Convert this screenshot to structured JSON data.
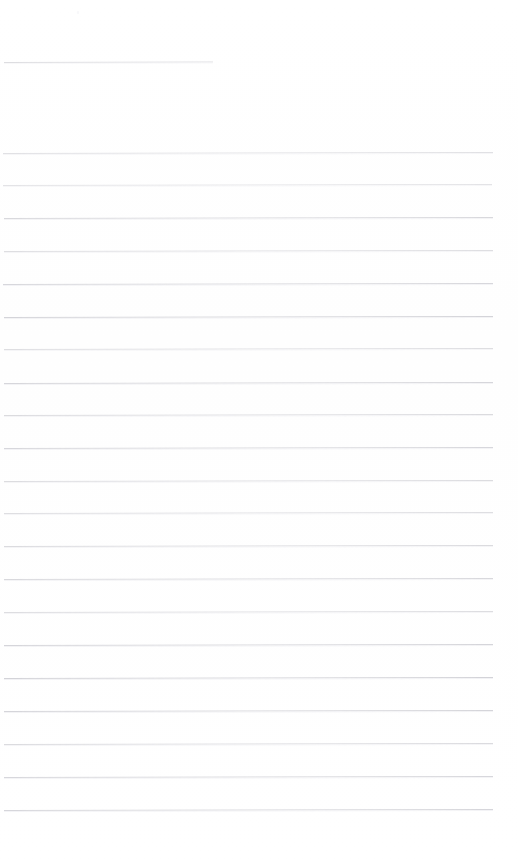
{
  "document": {
    "kind": "scanned-blank-ruled-page",
    "page_width": 518,
    "page_height": 864,
    "background_color": "#ffffff",
    "rule_color": "#c9c9cf",
    "visible_text": "",
    "caption": "Blank scanned ruled notebook page with no handwriting or printed text"
  },
  "rules": [
    {
      "id": "rule-header",
      "y": 62,
      "x": 4,
      "width": 209,
      "opacity": 0.62,
      "slope": -0.6,
      "kind": "short"
    },
    {
      "id": "rule-1",
      "y": 153,
      "x": 3,
      "width": 490,
      "opacity": 0.55,
      "slope": -0.9,
      "kind": "full"
    },
    {
      "id": "rule-2",
      "y": 185,
      "x": 3,
      "width": 489,
      "opacity": 0.5,
      "slope": -1.0,
      "kind": "full"
    },
    {
      "id": "rule-3",
      "y": 218,
      "x": 4,
      "width": 489,
      "opacity": 0.7,
      "slope": -1.1,
      "kind": "full"
    },
    {
      "id": "rule-4",
      "y": 251,
      "x": 4,
      "width": 489,
      "opacity": 0.6,
      "slope": -1.0,
      "kind": "full"
    },
    {
      "id": "rule-5",
      "y": 284,
      "x": 3,
      "width": 490,
      "opacity": 0.72,
      "slope": -1.0,
      "kind": "full"
    },
    {
      "id": "rule-6",
      "y": 317,
      "x": 4,
      "width": 489,
      "opacity": 0.78,
      "slope": -1.1,
      "kind": "full"
    },
    {
      "id": "rule-7",
      "y": 349,
      "x": 4,
      "width": 489,
      "opacity": 0.6,
      "slope": -1.0,
      "kind": "full"
    },
    {
      "id": "rule-8",
      "y": 383,
      "x": 4,
      "width": 489,
      "opacity": 0.74,
      "slope": -1.0,
      "kind": "full"
    },
    {
      "id": "rule-9",
      "y": 415,
      "x": 4,
      "width": 489,
      "opacity": 0.66,
      "slope": -1.0,
      "kind": "full"
    },
    {
      "id": "rule-10",
      "y": 448,
      "x": 4,
      "width": 489,
      "opacity": 0.72,
      "slope": -1.0,
      "kind": "full"
    },
    {
      "id": "rule-11",
      "y": 481,
      "x": 4,
      "width": 489,
      "opacity": 0.64,
      "slope": -1.0,
      "kind": "full"
    },
    {
      "id": "rule-12",
      "y": 513,
      "x": 4,
      "width": 489,
      "opacity": 0.6,
      "slope": -1.0,
      "kind": "full"
    },
    {
      "id": "rule-13",
      "y": 546,
      "x": 4,
      "width": 489,
      "opacity": 0.66,
      "slope": -1.0,
      "kind": "full"
    },
    {
      "id": "rule-14",
      "y": 579,
      "x": 4,
      "width": 489,
      "opacity": 0.7,
      "slope": -1.0,
      "kind": "full"
    },
    {
      "id": "rule-15",
      "y": 612,
      "x": 4,
      "width": 489,
      "opacity": 0.62,
      "slope": -1.0,
      "kind": "full"
    },
    {
      "id": "rule-16",
      "y": 645,
      "x": 4,
      "width": 489,
      "opacity": 0.76,
      "slope": -1.0,
      "kind": "full"
    },
    {
      "id": "rule-17",
      "y": 678,
      "x": 4,
      "width": 489,
      "opacity": 0.8,
      "slope": -1.0,
      "kind": "full"
    },
    {
      "id": "rule-18",
      "y": 711,
      "x": 4,
      "width": 489,
      "opacity": 0.76,
      "slope": -1.0,
      "kind": "full"
    },
    {
      "id": "rule-19",
      "y": 744,
      "x": 4,
      "width": 489,
      "opacity": 0.66,
      "slope": -1.0,
      "kind": "full"
    },
    {
      "id": "rule-20",
      "y": 777,
      "x": 4,
      "width": 489,
      "opacity": 0.72,
      "slope": -1.0,
      "kind": "full"
    },
    {
      "id": "rule-21",
      "y": 810,
      "x": 4,
      "width": 489,
      "opacity": 0.74,
      "slope": -1.0,
      "kind": "full"
    }
  ],
  "artifacts": [
    {
      "id": "speck-top-left",
      "x": 77,
      "y": 11,
      "opacity": 0.55
    }
  ]
}
